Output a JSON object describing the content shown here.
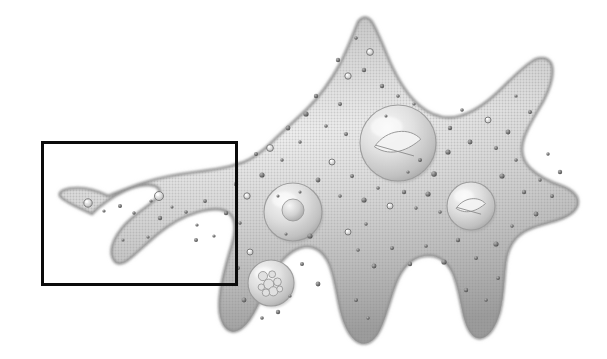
{
  "figure": {
    "title": "Amoeba cell illustration",
    "subject": "amoeba",
    "style": "grayscale halftone scientific illustration",
    "background_color": "#ffffff",
    "canvas": {
      "width": 607,
      "height": 359
    }
  },
  "annotation": {
    "type": "selection-rectangle",
    "label": "",
    "stroke_color": "#0b0b0b",
    "fill": "none",
    "stroke_width_px": 3,
    "x": 41,
    "y": 141,
    "width": 197,
    "height": 145,
    "region_described": "left pseudopod region"
  },
  "cell": {
    "name": "amoeba-body",
    "outline_color": "#8d8d8d",
    "fill_light": "#f2f2f2",
    "fill_mid": "#d5d5d5",
    "fill_dark": "#a8a8a8",
    "body_path": "M 92 214 C 74 206 62 200 60 196 C 58 191 66 188 78 188 C 90 188 100 192 108 196 C 118 192 132 186 146 182 C 162 177 180 174 196 172 C 212 170 226 168 238 164 C 252 160 262 152 272 142 C 284 130 296 120 308 108 C 320 96 330 82 340 64 C 348 48 354 32 358 22 C 362 16 368 16 372 22 C 378 32 384 48 390 62 C 398 80 408 96 420 106 C 432 116 446 120 460 116 C 474 112 488 102 502 88 C 514 76 524 66 534 60 C 542 56 550 58 552 66 C 554 76 550 88 544 100 C 536 114 528 126 524 138 C 520 150 522 160 530 168 C 538 176 550 182 562 186 C 572 190 578 196 578 202 C 578 210 570 216 558 220 C 546 224 534 226 524 232 C 514 238 508 248 506 262 C 504 278 504 296 500 312 C 496 326 490 336 482 338 C 474 340 468 332 464 318 C 460 302 458 284 452 272 C 446 260 436 254 424 256 C 412 258 402 268 396 284 C 390 300 386 318 380 330 C 374 342 366 346 358 342 C 350 338 344 326 340 310 C 336 292 334 274 328 262 C 322 250 312 244 300 248 C 288 252 278 264 270 280 C 262 296 256 312 248 322 C 240 332 232 334 226 328 C 220 322 218 310 220 294 C 222 276 228 258 232 244 C 236 230 236 220 230 214 C 224 208 212 208 198 212 C 184 216 170 224 158 234 C 146 244 136 254 128 260 C 120 266 114 264 112 256 C 110 248 114 238 122 228 C 130 218 142 210 150 204 C 158 198 162 192 158 188 C 154 184 144 184 132 188 C 120 192 108 200 98 208 C 94 212 92 214 92 214 Z",
    "granule_color": "#6f6f6f",
    "halftone_dot_color": "#9a9a9a"
  },
  "organelles": [
    {
      "name": "nucleus",
      "label": "nucleus",
      "cx": 398,
      "cy": 143,
      "r": 38,
      "inner_type": "crescent-inclusion",
      "shade": "#cfcfcf"
    },
    {
      "name": "contractile-vacuole",
      "label": "contractile vacuole",
      "cx": 293,
      "cy": 212,
      "r": 29,
      "inner_type": "central-sphere",
      "inner_r": 11,
      "shade": "#dcdcdc"
    },
    {
      "name": "food-vacuole-right",
      "label": "food vacuole",
      "cx": 471,
      "cy": 206,
      "r": 24,
      "inner_type": "crescent-inclusion",
      "shade": "#d4d4d4"
    },
    {
      "name": "food-vacuole-lower",
      "label": "food vacuole",
      "cx": 271,
      "cy": 283,
      "r": 23,
      "inner_type": "granular-cluster",
      "shade": "#d8d8d8"
    }
  ],
  "granules": [
    {
      "cx": 88,
      "cy": 203,
      "r": 4.2
    },
    {
      "cx": 104,
      "cy": 211,
      "r": 1.6
    },
    {
      "cx": 120,
      "cy": 206,
      "r": 2.0
    },
    {
      "cx": 134,
      "cy": 213,
      "r": 1.7
    },
    {
      "cx": 151,
      "cy": 201,
      "r": 1.6
    },
    {
      "cx": 160,
      "cy": 218,
      "r": 2.2
    },
    {
      "cx": 172,
      "cy": 207,
      "r": 1.5
    },
    {
      "cx": 159,
      "cy": 196,
      "r": 4.5
    },
    {
      "cx": 186,
      "cy": 212,
      "r": 1.8
    },
    {
      "cx": 197,
      "cy": 225,
      "r": 1.6
    },
    {
      "cx": 205,
      "cy": 201,
      "r": 1.9
    },
    {
      "cx": 196,
      "cy": 240,
      "r": 2.0
    },
    {
      "cx": 214,
      "cy": 236,
      "r": 1.6
    },
    {
      "cx": 148,
      "cy": 237,
      "r": 1.6
    },
    {
      "cx": 123,
      "cy": 240,
      "r": 1.5
    },
    {
      "cx": 226,
      "cy": 213,
      "r": 2.2
    },
    {
      "cx": 240,
      "cy": 223,
      "r": 1.7
    },
    {
      "cx": 247,
      "cy": 196,
      "r": 3.2
    },
    {
      "cx": 236,
      "cy": 184,
      "r": 2.2
    },
    {
      "cx": 262,
      "cy": 175,
      "r": 2.6
    },
    {
      "cx": 256,
      "cy": 154,
      "r": 2.0
    },
    {
      "cx": 270,
      "cy": 148,
      "r": 3.4
    },
    {
      "cx": 282,
      "cy": 160,
      "r": 1.7
    },
    {
      "cx": 288,
      "cy": 128,
      "r": 2.4
    },
    {
      "cx": 300,
      "cy": 142,
      "r": 1.7
    },
    {
      "cx": 306,
      "cy": 114,
      "r": 2.6
    },
    {
      "cx": 316,
      "cy": 96,
      "r": 2.2
    },
    {
      "cx": 326,
      "cy": 126,
      "r": 1.8
    },
    {
      "cx": 340,
      "cy": 104,
      "r": 2.0
    },
    {
      "cx": 348,
      "cy": 76,
      "r": 3.2
    },
    {
      "cx": 338,
      "cy": 60,
      "r": 2.2
    },
    {
      "cx": 364,
      "cy": 70,
      "r": 2.2
    },
    {
      "cx": 370,
      "cy": 52,
      "r": 3.4
    },
    {
      "cx": 356,
      "cy": 38,
      "r": 1.8
    },
    {
      "cx": 382,
      "cy": 86,
      "r": 2.2
    },
    {
      "cx": 346,
      "cy": 134,
      "r": 2.0
    },
    {
      "cx": 332,
      "cy": 162,
      "r": 3.0
    },
    {
      "cx": 318,
      "cy": 180,
      "r": 2.4
    },
    {
      "cx": 340,
      "cy": 196,
      "r": 1.8
    },
    {
      "cx": 352,
      "cy": 176,
      "r": 2.0
    },
    {
      "cx": 364,
      "cy": 200,
      "r": 2.6
    },
    {
      "cx": 378,
      "cy": 188,
      "r": 1.8
    },
    {
      "cx": 390,
      "cy": 206,
      "r": 3.0
    },
    {
      "cx": 404,
      "cy": 192,
      "r": 2.2
    },
    {
      "cx": 416,
      "cy": 208,
      "r": 1.7
    },
    {
      "cx": 428,
      "cy": 194,
      "r": 2.6
    },
    {
      "cx": 440,
      "cy": 212,
      "r": 1.8
    },
    {
      "cx": 434,
      "cy": 174,
      "r": 2.8
    },
    {
      "cx": 420,
      "cy": 160,
      "r": 2.0
    },
    {
      "cx": 448,
      "cy": 152,
      "r": 2.6
    },
    {
      "cx": 450,
      "cy": 128,
      "r": 2.2
    },
    {
      "cx": 462,
      "cy": 110,
      "r": 1.8
    },
    {
      "cx": 470,
      "cy": 142,
      "r": 2.4
    },
    {
      "cx": 488,
      "cy": 120,
      "r": 3.0
    },
    {
      "cx": 496,
      "cy": 148,
      "r": 2.0
    },
    {
      "cx": 508,
      "cy": 132,
      "r": 2.4
    },
    {
      "cx": 516,
      "cy": 160,
      "r": 1.8
    },
    {
      "cx": 502,
      "cy": 176,
      "r": 2.6
    },
    {
      "cx": 524,
      "cy": 192,
      "r": 2.2
    },
    {
      "cx": 540,
      "cy": 180,
      "r": 1.7
    },
    {
      "cx": 552,
      "cy": 196,
      "r": 2.0
    },
    {
      "cx": 536,
      "cy": 214,
      "r": 2.4
    },
    {
      "cx": 512,
      "cy": 226,
      "r": 1.8
    },
    {
      "cx": 496,
      "cy": 244,
      "r": 2.6
    },
    {
      "cx": 476,
      "cy": 258,
      "r": 2.0
    },
    {
      "cx": 458,
      "cy": 240,
      "r": 2.2
    },
    {
      "cx": 444,
      "cy": 262,
      "r": 2.6
    },
    {
      "cx": 426,
      "cy": 246,
      "r": 1.8
    },
    {
      "cx": 410,
      "cy": 264,
      "r": 2.2
    },
    {
      "cx": 392,
      "cy": 248,
      "r": 2.0
    },
    {
      "cx": 374,
      "cy": 266,
      "r": 2.4
    },
    {
      "cx": 358,
      "cy": 250,
      "r": 1.8
    },
    {
      "cx": 348,
      "cy": 232,
      "r": 3.0
    },
    {
      "cx": 366,
      "cy": 224,
      "r": 1.7
    },
    {
      "cx": 310,
      "cy": 236,
      "r": 2.6
    },
    {
      "cx": 302,
      "cy": 264,
      "r": 2.0
    },
    {
      "cx": 318,
      "cy": 284,
      "r": 2.4
    },
    {
      "cx": 250,
      "cy": 252,
      "r": 3.0
    },
    {
      "cx": 238,
      "cy": 268,
      "r": 2.0
    },
    {
      "cx": 244,
      "cy": 300,
      "r": 2.4
    },
    {
      "cx": 262,
      "cy": 318,
      "r": 1.8
    },
    {
      "cx": 278,
      "cy": 312,
      "r": 2.2
    },
    {
      "cx": 290,
      "cy": 296,
      "r": 1.6
    },
    {
      "cx": 356,
      "cy": 300,
      "r": 2.0
    },
    {
      "cx": 368,
      "cy": 318,
      "r": 1.7
    },
    {
      "cx": 466,
      "cy": 290,
      "r": 2.2
    },
    {
      "cx": 486,
      "cy": 300,
      "r": 1.8
    },
    {
      "cx": 498,
      "cy": 278,
      "r": 2.0
    },
    {
      "cx": 560,
      "cy": 172,
      "r": 2.2
    },
    {
      "cx": 548,
      "cy": 154,
      "r": 1.7
    },
    {
      "cx": 530,
      "cy": 112,
      "r": 2.0
    },
    {
      "cx": 516,
      "cy": 96,
      "r": 1.6
    },
    {
      "cx": 398,
      "cy": 96,
      "r": 1.8
    },
    {
      "cx": 414,
      "cy": 104,
      "r": 1.6
    },
    {
      "cx": 386,
      "cy": 116,
      "r": 1.5
    },
    {
      "cx": 408,
      "cy": 172,
      "r": 1.6
    },
    {
      "cx": 278,
      "cy": 196,
      "r": 1.5
    },
    {
      "cx": 300,
      "cy": 192,
      "r": 1.5
    },
    {
      "cx": 286,
      "cy": 234,
      "r": 1.5
    }
  ]
}
